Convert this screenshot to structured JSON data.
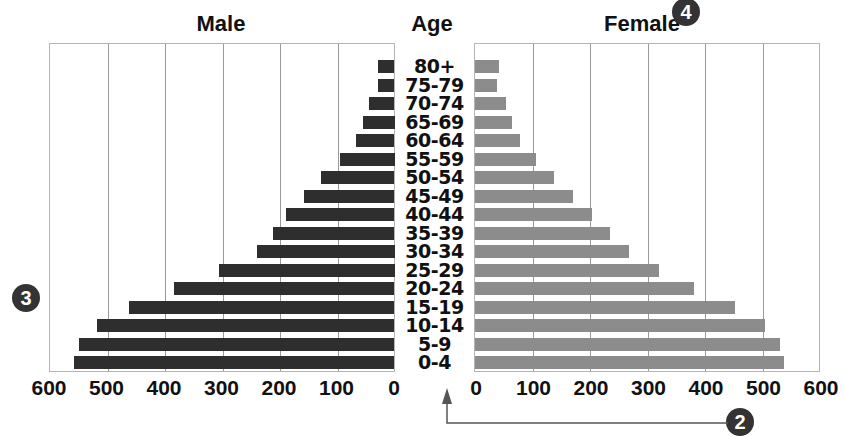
{
  "chart_data": {
    "type": "bar",
    "orientation": "horizontal",
    "subtype": "population-pyramid",
    "titles": {
      "left": "Male",
      "center": "Age",
      "right": "Female"
    },
    "categories": [
      "80+",
      "75-79",
      "70-74",
      "65-69",
      "60-64",
      "55-59",
      "50-54",
      "45-49",
      "40-44",
      "35-39",
      "30-34",
      "25-29",
      "20-24",
      "15-19",
      "10-14",
      "5-9",
      "0-4"
    ],
    "series": [
      {
        "name": "Male",
        "color": "#2e2e2e",
        "values": [
          29,
          29,
          44,
          55,
          67,
          95,
          128,
          158,
          189,
          212,
          240,
          305,
          384,
          462,
          518,
          549,
          557
        ]
      },
      {
        "name": "Female",
        "color": "#8c8c8c",
        "values": [
          42,
          38,
          54,
          65,
          78,
          106,
          138,
          170,
          204,
          234,
          267,
          320,
          380,
          453,
          505,
          531,
          537
        ]
      }
    ],
    "xaxis": {
      "male_ticks": [
        "600",
        "500",
        "400",
        "300",
        "200",
        "100",
        "0"
      ],
      "female_ticks": [
        "0",
        "100",
        "200",
        "300",
        "400",
        "500",
        "600"
      ],
      "range": [
        0,
        600
      ]
    },
    "grid": true,
    "annotations": [
      {
        "label": "4",
        "position": "top-right near Female title"
      },
      {
        "label": "3",
        "position": "left of male panel"
      },
      {
        "label": "2",
        "position": "bottom right, with arrow pointing up to age axis"
      }
    ]
  },
  "badges": {
    "b4": "4",
    "b3": "3",
    "b2": "2"
  }
}
